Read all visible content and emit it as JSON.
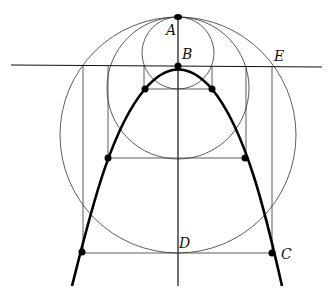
{
  "diagram": {
    "labels": {
      "A": "A",
      "B": "B",
      "C": "C",
      "D": "D",
      "E": "E"
    },
    "colors": {
      "line": "#333333",
      "curve": "#000000",
      "background": "#ffffff"
    },
    "points": {
      "A": [
        178,
        17
      ],
      "B": [
        178,
        66
      ],
      "C": [
        271,
        253
      ],
      "D": [
        178,
        253
      ],
      "E": [
        272,
        66
      ]
    },
    "circles": [
      {
        "name": "small",
        "cx": 178,
        "cy": 53,
        "r": 36
      },
      {
        "name": "medium",
        "cx": 178,
        "cy": 88,
        "r": 71
      },
      {
        "name": "large",
        "cx": 178,
        "cy": 135,
        "r": 118
      }
    ],
    "parabola_points": [
      [
        82,
        253
      ],
      [
        108,
        158
      ],
      [
        145,
        89
      ],
      [
        178,
        66
      ],
      [
        212,
        89
      ],
      [
        245,
        158
      ],
      [
        271,
        253
      ]
    ]
  }
}
